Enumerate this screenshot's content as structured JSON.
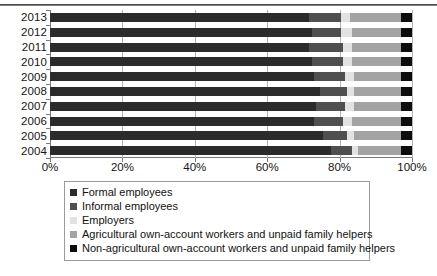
{
  "chart_data": {
    "type": "bar",
    "orientation": "horizontal",
    "stacked": true,
    "normalized_percent": true,
    "title": "",
    "xlabel": "",
    "ylabel": "",
    "xlim": [
      0,
      100
    ],
    "xticks": [
      "0%",
      "20%",
      "40%",
      "60%",
      "80%",
      "100%"
    ],
    "xtick_values": [
      0,
      20,
      40,
      60,
      80,
      100
    ],
    "grid": true,
    "grid_axis": "x",
    "legend_position": "bottom",
    "categories": [
      "2013",
      "2012",
      "2011",
      "2010",
      "2009",
      "2008",
      "2007",
      "2006",
      "2005",
      "2004"
    ],
    "series": [
      {
        "name": "Formal employees",
        "color": "#2b2b2b",
        "values": [
          71.5,
          72.5,
          71.5,
          72.5,
          73.0,
          74.5,
          73.5,
          73.0,
          75.5,
          77.5
        ]
      },
      {
        "name": "Informal employees",
        "color": "#4f4f4f",
        "values": [
          9.0,
          8.0,
          9.5,
          8.5,
          8.5,
          7.5,
          8.0,
          8.0,
          6.5,
          6.0
        ]
      },
      {
        "name": "Employers",
        "color": "#e2e2e2",
        "values": [
          2.5,
          3.0,
          2.5,
          2.5,
          2.5,
          2.0,
          2.5,
          2.5,
          2.0,
          1.5
        ]
      },
      {
        "name": "Agricultural own-account workers and unpaid family helpers",
        "color": "#a3a3a3",
        "values": [
          14.0,
          13.5,
          13.5,
          13.5,
          13.0,
          13.0,
          13.0,
          13.5,
          13.0,
          12.0
        ]
      },
      {
        "name": "Non-agricultural own-account workers and unpaid family helpers",
        "color": "#0d0d0d",
        "values": [
          3.0,
          3.0,
          3.0,
          3.0,
          3.0,
          3.0,
          3.0,
          3.0,
          3.0,
          3.0
        ]
      }
    ]
  },
  "legend": {
    "items": [
      {
        "label": "Formal employees",
        "color": "#2b2b2b"
      },
      {
        "label": "Informal employees",
        "color": "#4f4f4f"
      },
      {
        "label": "Employers",
        "color": "#e2e2e2"
      },
      {
        "label": "Agricultural own-account workers and unpaid family helpers",
        "color": "#a3a3a3"
      },
      {
        "label": "Non-agricultural own-account workers and unpaid family helpers",
        "color": "#0d0d0d"
      }
    ]
  }
}
